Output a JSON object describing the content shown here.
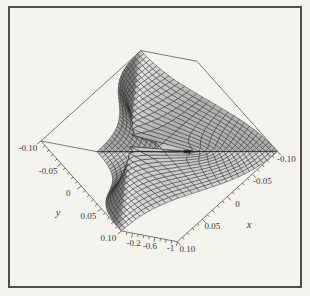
{
  "chart_data": {
    "type": "surface",
    "title": "",
    "x_label": "x",
    "y_label": "y",
    "z_label": "",
    "x_range": [
      -0.1,
      0.1
    ],
    "y_range": [
      -0.1,
      0.1
    ],
    "z_range": [
      -1,
      0
    ],
    "x_ticks": [
      {
        "value": 0.1,
        "label": "0.10"
      },
      {
        "value": 0.05,
        "label": "0.05"
      },
      {
        "value": 0,
        "label": "0"
      },
      {
        "value": -0.05,
        "label": "-0.05"
      },
      {
        "value": -0.1,
        "label": "-0.10"
      }
    ],
    "y_ticks": [
      {
        "value": -0.1,
        "label": "-0.10"
      },
      {
        "value": -0.05,
        "label": "-0.05"
      },
      {
        "value": 0,
        "label": "0"
      },
      {
        "value": 0.05,
        "label": "0.05"
      },
      {
        "value": 0.1,
        "label": "0.10"
      }
    ],
    "z_ticks": [
      {
        "value": -0.2,
        "label": "-0.2"
      },
      {
        "value": -0.6,
        "label": "-0.6"
      },
      {
        "value": -1,
        "label": "-1"
      }
    ],
    "x_minor_tick_step": 0.01,
    "y_minor_tick_step": 0.01,
    "z_minor_tick_step": 0.1,
    "z_function": "x*y/(x^2+y^2) - 0.5",
    "z_function_note": "indeterminate at (0,0); surface dips to -1 along y=-x and rises to 0 along y=x",
    "mesh_divisions": 30,
    "grid_samples": {
      "x_values": [
        -0.1,
        -0.075,
        -0.05,
        -0.025,
        0,
        0.025,
        0.05,
        0.075,
        0.1
      ],
      "y_values": [
        -0.1,
        -0.075,
        -0.05,
        -0.025,
        0,
        0.025,
        0.05,
        0.075,
        0.1
      ],
      "z_values": [
        [
          0,
          -0.02,
          -0.1,
          -0.265,
          -0.5,
          -0.735,
          -0.9,
          -0.98,
          -1
        ],
        [
          -0.02,
          0,
          -0.038,
          -0.2,
          -0.5,
          -0.8,
          -0.962,
          -1,
          -0.98
        ],
        [
          -0.1,
          -0.038,
          0,
          -0.1,
          -0.5,
          -0.9,
          -1,
          -0.962,
          -0.9
        ],
        [
          -0.265,
          -0.2,
          -0.1,
          0,
          -0.5,
          -1,
          -0.9,
          -0.8,
          -0.735
        ],
        [
          -0.5,
          -0.5,
          -0.5,
          -0.5,
          -0.5,
          -0.5,
          -0.5,
          -0.5,
          -0.5
        ],
        [
          -0.735,
          -0.8,
          -0.9,
          -1,
          -0.5,
          0,
          -0.1,
          -0.2,
          -0.265
        ],
        [
          -0.9,
          -0.962,
          -1,
          -0.9,
          -0.5,
          -0.1,
          0,
          -0.038,
          -0.1
        ],
        [
          -0.98,
          -1,
          -0.962,
          -0.8,
          -0.5,
          -0.2,
          -0.038,
          0,
          -0.02
        ],
        [
          -1,
          -0.98,
          -0.9,
          -0.735,
          -0.5,
          -0.265,
          -0.1,
          -0.02,
          0
        ]
      ]
    },
    "legend": null,
    "grid_on": true
  },
  "style": {
    "paper": "#f5f3ee",
    "frame": "#4f4d49",
    "box_edge": "#6e6c66",
    "tick": "#55534e",
    "label": "#3d3b36",
    "mesh_line": "#232323",
    "crease": "#1c1c1c"
  }
}
